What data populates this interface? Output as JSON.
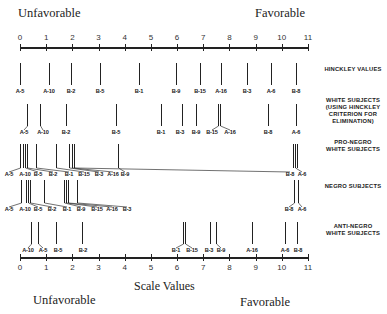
{
  "chart_data": {
    "type": "scatter",
    "title": "",
    "xlabel": "Scale Values",
    "ylabel": "",
    "xlim": [
      0,
      11
    ],
    "ticks": [
      0,
      1,
      2,
      3,
      4,
      5,
      6,
      7,
      8,
      9,
      10,
      11
    ],
    "top_left_label": "Unfavorable",
    "top_right_label": "Favorable",
    "bottom_left_label": "Unfavorable",
    "bottom_right_label": "Favorable",
    "series": [
      {
        "name": "HINCKLEY VALUES",
        "title_lines": [
          "HINCKLEY VALUES"
        ],
        "points": [
          {
            "label": "A-5",
            "value": 0.0
          },
          {
            "label": "A-10",
            "value": 1.1
          },
          {
            "label": "B-2",
            "value": 1.95
          },
          {
            "label": "B-5",
            "value": 3.05
          },
          {
            "label": "B-1",
            "value": 4.55
          },
          {
            "label": "B-9",
            "value": 5.95
          },
          {
            "label": "B-15",
            "value": 6.9
          },
          {
            "label": "A-16",
            "value": 7.7
          },
          {
            "label": "B-3",
            "value": 8.7
          },
          {
            "label": "A-6",
            "value": 9.6
          },
          {
            "label": "B-8",
            "value": 10.55
          }
        ]
      },
      {
        "name": "WHITE SUBJECTS (USING HINCKLEY CRITERION FOR ELIMINATION)",
        "title_lines": [
          "WHITE SUBJECTS",
          "(USING HINCKLEY",
          "CRITERION FOR",
          "ELIMINATION)"
        ],
        "points": [
          {
            "label": "A-5",
            "value": 0.25
          },
          {
            "label": "A-10",
            "value": 0.75
          },
          {
            "label": "B-2",
            "value": 1.75
          },
          {
            "label": "B-5",
            "value": 3.65
          },
          {
            "label": "B-1",
            "value": 5.4
          },
          {
            "label": "B-3",
            "value": 6.2
          },
          {
            "label": "B-9",
            "value": 6.7
          },
          {
            "label": "B-15",
            "value": 7.55
          },
          {
            "label": "A-16",
            "value": 7.65
          },
          {
            "label": "B-8",
            "value": 9.5
          },
          {
            "label": "A-6",
            "value": 10.55
          }
        ]
      },
      {
        "name": "PRO-NEGRO WHITE SUBJECTS",
        "title_lines": [
          "PRO-NEGRO",
          "WHITE SUBJECTS"
        ],
        "points": [
          {
            "label": "A-5",
            "value": 0.0
          },
          {
            "label": "A-10",
            "value": 0.1
          },
          {
            "label": "B-5",
            "value": 0.2
          },
          {
            "label": "B-2",
            "value": 0.3
          },
          {
            "label": "B-1",
            "value": 0.6
          },
          {
            "label": "B-15",
            "value": 1.4
          },
          {
            "label": "B-3",
            "value": 1.9
          },
          {
            "label": "A-16",
            "value": 2.0
          },
          {
            "label": "B-9",
            "value": 2.1
          },
          {
            "label": "B-8",
            "value": 3.75
          },
          {
            "label": "A-6",
            "value": 10.45
          },
          {
            "label": "A-6b",
            "value": 10.6
          }
        ],
        "labels_shown": [
          "A-5",
          "A-10",
          "B-5",
          "B-2",
          "B-1",
          "B-15",
          "B-3",
          "A-16",
          "B-9",
          "B-8",
          "A-6"
        ]
      },
      {
        "name": "NEGRO SUBJECTS",
        "title_lines": [
          "NEGRO SUBJECTS"
        ],
        "points": [
          {
            "label": "A-5",
            "value": 0.1
          },
          {
            "label": "A-10",
            "value": 0.3
          },
          {
            "label": "B-5",
            "value": 0.45
          },
          {
            "label": "B-2",
            "value": 1.55
          },
          {
            "label": "B-1",
            "value": 2.4
          },
          {
            "label": "B-9",
            "value": 2.5
          },
          {
            "label": "B-15",
            "value": 2.55
          },
          {
            "label": "A-16",
            "value": 2.6
          },
          {
            "label": "B-3",
            "value": 3.0
          },
          {
            "label": "B-8",
            "value": 10.45
          },
          {
            "label": "A-6",
            "value": 10.65
          }
        ]
      },
      {
        "name": "ANTI-NEGRO WHITE SUBJECTS",
        "title_lines": [
          "ANTI-NEGRO",
          "WHITE SUBJECTS"
        ],
        "points": [
          {
            "label": "A-10",
            "value": 0.6
          },
          {
            "label": "A-5",
            "value": 1.0
          },
          {
            "label": "B-5",
            "value": 1.7
          },
          {
            "label": "B-2",
            "value": 2.7
          },
          {
            "label": "B-1",
            "value": 6.25
          },
          {
            "label": "B-15",
            "value": 6.35
          },
          {
            "label": "B-3",
            "value": 7.0
          },
          {
            "label": "B-9",
            "value": 7.25
          },
          {
            "label": "A-16",
            "value": 8.55
          },
          {
            "label": "A-6",
            "value": 9.85
          },
          {
            "label": "B-8",
            "value": 10.35
          }
        ]
      }
    ]
  },
  "rows": [
    {
      "title_lines": [
        "HINCKLEY VALUES"
      ],
      "marks": [
        {
          "label": "A-5",
          "x": 20,
          "lx": 20
        },
        {
          "label": "A-10",
          "x": 49,
          "lx": 49
        },
        {
          "label": "B-2",
          "x": 71,
          "lx": 71
        },
        {
          "label": "B-5",
          "x": 100,
          "lx": 100
        },
        {
          "label": "B-1",
          "x": 139,
          "lx": 139
        },
        {
          "label": "B-9",
          "x": 176,
          "lx": 176
        },
        {
          "label": "B-15",
          "x": 200,
          "lx": 200
        },
        {
          "label": "A-16",
          "x": 221,
          "lx": 221
        },
        {
          "label": "B-3",
          "x": 247,
          "lx": 247
        },
        {
          "label": "A-6",
          "x": 271,
          "lx": 271
        },
        {
          "label": "B-8",
          "x": 296,
          "lx": 296
        }
      ]
    },
    {
      "title_lines": [
        "WHITE SUBJECTS",
        "(USING HINCKLEY",
        "CRITERION FOR",
        "ELIMINATION)"
      ],
      "marks": [
        {
          "label": "A-5",
          "x": 27,
          "lx": 24
        },
        {
          "label": "A-10",
          "x": 40,
          "lx": 43
        },
        {
          "label": "B-2",
          "x": 66,
          "lx": 66
        },
        {
          "label": "B-5",
          "x": 116,
          "lx": 116
        },
        {
          "label": "B-1",
          "x": 161,
          "lx": 161
        },
        {
          "label": "B-3",
          "x": 182,
          "lx": 180
        },
        {
          "label": "B-9",
          "x": 196,
          "lx": 196
        },
        {
          "label": "B-15",
          "x": 218,
          "lx": 212
        },
        {
          "label": "A-16",
          "x": 220,
          "lx": 230
        },
        {
          "label": "B-8",
          "x": 268,
          "lx": 268
        },
        {
          "label": "A-6",
          "x": 296,
          "lx": 296
        }
      ]
    },
    {
      "title_lines": [
        "PRO-NEGRO",
        "WHITE SUBJECTS"
      ],
      "marks": [
        {
          "label": "A-5",
          "x": 20,
          "lx": 9
        },
        {
          "label": "A-10",
          "x": 23,
          "lx": 25
        },
        {
          "label": "B-5",
          "x": 25,
          "lx": 38
        },
        {
          "label": "B-2",
          "x": 27,
          "lx": 53
        },
        {
          "label": "B-1",
          "x": 36,
          "lx": 69
        },
        {
          "label": "B-15",
          "x": 56,
          "lx": 84
        },
        {
          "label": "B-3",
          "x": 69,
          "lx": 99
        },
        {
          "label": "A-16",
          "x": 72,
          "lx": 113
        },
        {
          "label": "B-9",
          "x": 118,
          "lx": 125
        },
        {
          "label": "B-8",
          "x": 74,
          "lx": 290
        },
        {
          "label": "A-6",
          "x": 295,
          "lx": 302
        }
      ],
      "extra_lines": [
        293,
        297
      ]
    },
    {
      "title_lines": [
        "NEGRO SUBJECTS"
      ],
      "marks": [
        {
          "label": "A-5",
          "x": 21,
          "lx": 9
        },
        {
          "label": "A-10",
          "x": 26,
          "lx": 25
        },
        {
          "label": "B-5",
          "x": 28,
          "lx": 38
        },
        {
          "label": "B-2",
          "x": 30,
          "lx": 52
        },
        {
          "label": "B-1",
          "x": 44,
          "lx": 67
        },
        {
          "label": "B-9",
          "x": 64,
          "lx": 81
        },
        {
          "label": "B-15",
          "x": 66,
          "lx": 97
        },
        {
          "label": "A-16",
          "x": 68,
          "lx": 112
        },
        {
          "label": "B-3",
          "x": 77,
          "lx": 127
        },
        {
          "label": "B-8",
          "x": 294,
          "lx": 289
        },
        {
          "label": "A-6",
          "x": 298,
          "lx": 302
        }
      ]
    },
    {
      "title_lines": [
        "ANTI-NEGRO",
        "WHITE SUBJECTS"
      ],
      "marks": [
        {
          "label": "A-10",
          "x": 31,
          "lx": 28
        },
        {
          "label": "A-5",
          "x": 38,
          "lx": 43
        },
        {
          "label": "B-5",
          "x": 56,
          "lx": 58
        },
        {
          "label": "B-2",
          "x": 82,
          "lx": 83
        },
        {
          "label": "B-1",
          "x": 183,
          "lx": 176
        },
        {
          "label": "B-15",
          "x": 185,
          "lx": 192
        },
        {
          "label": "B-3",
          "x": 210,
          "lx": 209
        },
        {
          "label": "B-9",
          "x": 216,
          "lx": 221
        },
        {
          "label": "A-16",
          "x": 252,
          "lx": 252
        },
        {
          "label": "A-6",
          "x": 285,
          "lx": 285
        },
        {
          "label": "B-8",
          "x": 297,
          "lx": 298
        }
      ]
    }
  ]
}
